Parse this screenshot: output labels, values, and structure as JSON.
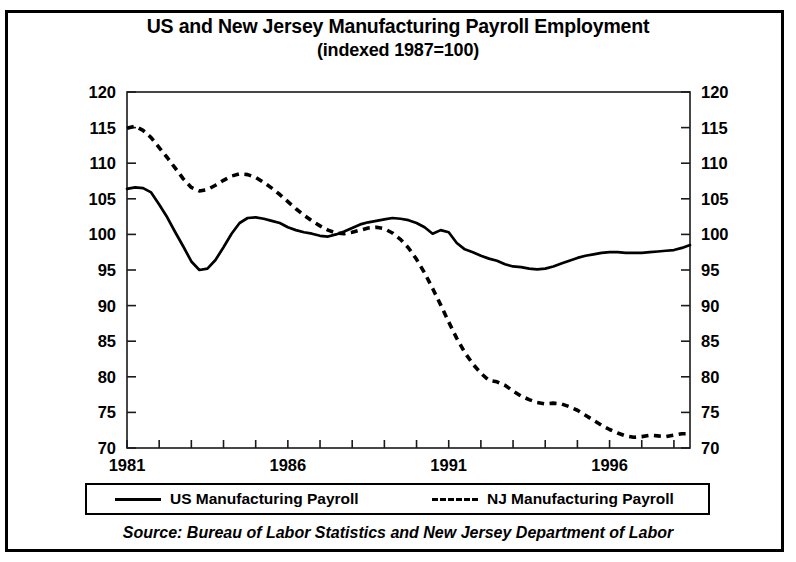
{
  "figure": {
    "title_line1": "US and New Jersey Manufacturing Payroll Employment",
    "title_line2": "(indexed 1987=100)",
    "source": "Source:  Bureau of Labor Statistics and New Jersey Department of Labor"
  },
  "legend": {
    "items": [
      {
        "label": "US Manufacturing Payroll",
        "style": "solid",
        "color": "#000000"
      },
      {
        "label": "NJ Manufacturing Payroll",
        "style": "dashed",
        "color": "#000000"
      }
    ]
  },
  "axes": {
    "y_ticks": [
      "120",
      "115",
      "110",
      "105",
      "100",
      "95",
      "90",
      "85",
      "80",
      "75",
      "70"
    ],
    "x_ticks": [
      "1981",
      "1986",
      "1991",
      "1996"
    ]
  },
  "chart_data": {
    "type": "line",
    "title": "US and New Jersey Manufacturing Payroll Employment (indexed 1987=100)",
    "subtitle": "(indexed 1987=100)",
    "xlabel": "",
    "ylabel": "",
    "xlim": [
      1981,
      1998.5
    ],
    "ylim": [
      70,
      120
    ],
    "y_ticks": [
      70,
      75,
      80,
      85,
      90,
      95,
      100,
      105,
      110,
      115,
      120
    ],
    "x_ticks_labeled": [
      1981,
      1986,
      1991,
      1996
    ],
    "x_tick_interval": 1,
    "grid": false,
    "legend_position": "below-plot",
    "dual_y_axis_mirrored": true,
    "series": [
      {
        "name": "US Manufacturing Payroll",
        "style": "solid",
        "color": "#000000",
        "x": [
          1981.0,
          1981.25,
          1981.5,
          1981.75,
          1982.0,
          1982.25,
          1982.5,
          1982.75,
          1983.0,
          1983.25,
          1983.5,
          1983.75,
          1984.0,
          1984.25,
          1984.5,
          1984.75,
          1985.0,
          1985.25,
          1985.5,
          1985.75,
          1986.0,
          1986.25,
          1986.5,
          1986.75,
          1987.0,
          1987.25,
          1987.5,
          1987.75,
          1988.0,
          1988.25,
          1988.5,
          1988.75,
          1989.0,
          1989.25,
          1989.5,
          1989.75,
          1990.0,
          1990.25,
          1990.5,
          1990.75,
          1991.0,
          1991.25,
          1991.5,
          1991.75,
          1992.0,
          1992.25,
          1992.5,
          1992.75,
          1993.0,
          1993.25,
          1993.5,
          1993.75,
          1994.0,
          1994.25,
          1994.5,
          1994.75,
          1995.0,
          1995.25,
          1995.5,
          1995.75,
          1996.0,
          1996.25,
          1996.5,
          1996.75,
          1997.0,
          1997.25,
          1997.5,
          1997.75,
          1998.0,
          1998.25,
          1998.5
        ],
        "values": [
          106.4,
          106.6,
          106.5,
          105.9,
          104.2,
          102.4,
          100.3,
          98.3,
          96.2,
          95.0,
          95.2,
          96.4,
          98.2,
          100.1,
          101.6,
          102.3,
          102.4,
          102.2,
          101.9,
          101.6,
          101.0,
          100.6,
          100.3,
          100.1,
          99.8,
          99.7,
          100.0,
          100.4,
          100.9,
          101.4,
          101.7,
          101.9,
          102.1,
          102.3,
          102.2,
          102.0,
          101.6,
          101.0,
          100.1,
          100.6,
          100.3,
          98.8,
          97.9,
          97.5,
          97.0,
          96.6,
          96.3,
          95.8,
          95.5,
          95.4,
          95.2,
          95.1,
          95.2,
          95.5,
          95.9,
          96.3,
          96.7,
          97.0,
          97.2,
          97.4,
          97.5,
          97.5,
          97.4,
          97.4,
          97.4,
          97.5,
          97.6,
          97.7,
          97.8,
          98.1,
          98.5
        ]
      },
      {
        "name": "NJ Manufacturing Payroll",
        "style": "dashed",
        "color": "#000000",
        "x": [
          1981.0,
          1981.25,
          1981.5,
          1981.75,
          1982.0,
          1982.25,
          1982.5,
          1982.75,
          1983.0,
          1983.25,
          1983.5,
          1983.75,
          1984.0,
          1984.25,
          1984.5,
          1984.75,
          1985.0,
          1985.25,
          1985.5,
          1985.75,
          1986.0,
          1986.25,
          1986.5,
          1986.75,
          1987.0,
          1987.25,
          1987.5,
          1987.75,
          1988.0,
          1988.25,
          1988.5,
          1988.75,
          1989.0,
          1989.25,
          1989.5,
          1989.75,
          1990.0,
          1990.25,
          1990.5,
          1990.75,
          1991.0,
          1991.25,
          1991.5,
          1991.75,
          1992.0,
          1992.25,
          1992.5,
          1992.75,
          1993.0,
          1993.25,
          1993.5,
          1993.75,
          1994.0,
          1994.25,
          1994.5,
          1994.75,
          1995.0,
          1995.25,
          1995.5,
          1995.75,
          1996.0,
          1996.25,
          1996.5,
          1996.75,
          1997.0,
          1997.25,
          1997.5,
          1997.75,
          1998.0,
          1998.25,
          1998.5
        ],
        "values": [
          114.9,
          115.2,
          114.6,
          113.6,
          112.2,
          110.8,
          109.3,
          107.8,
          106.6,
          106.1,
          106.3,
          106.9,
          107.6,
          108.2,
          108.5,
          108.4,
          108.0,
          107.3,
          106.5,
          105.6,
          104.6,
          103.6,
          102.7,
          101.9,
          101.2,
          100.6,
          100.2,
          100.1,
          100.3,
          100.6,
          100.9,
          101.0,
          100.8,
          100.2,
          99.3,
          98.1,
          96.5,
          94.6,
          92.4,
          90.1,
          87.7,
          85.4,
          83.4,
          81.8,
          80.5,
          79.5,
          79.3,
          78.8,
          78.0,
          77.3,
          76.8,
          76.4,
          76.2,
          76.3,
          76.2,
          75.8,
          75.3,
          74.6,
          73.9,
          73.2,
          72.6,
          72.1,
          71.7,
          71.5,
          71.6,
          71.8,
          71.7,
          71.6,
          71.8,
          72.0,
          72.0
        ]
      }
    ]
  }
}
